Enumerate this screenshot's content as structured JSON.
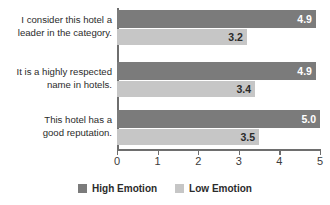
{
  "chart_data": {
    "type": "bar",
    "orientation": "horizontal",
    "title": "",
    "xlabel": "",
    "ylabel": "",
    "xlim": [
      0,
      5
    ],
    "grid": false,
    "legend_position": "bottom",
    "xticks": [
      "0",
      "1",
      "2",
      "3",
      "4",
      "5"
    ],
    "categories": [
      "I consider this hotel a leader in the category.",
      "It is a highly respected name in hotels.",
      "This hotel has a good reputation."
    ],
    "category_lines": [
      [
        "I consider this hotel a",
        "leader in the category."
      ],
      [
        "It is a highly respected",
        "name in hotels."
      ],
      [
        "This hotel has a",
        "good reputation."
      ]
    ],
    "series": [
      {
        "name": "High Emotion",
        "color": "#7b7b7b",
        "values": [
          4.9,
          4.9,
          5.0
        ],
        "labels": [
          "4.9",
          "4.9",
          "5.0"
        ]
      },
      {
        "name": "Low Emotion",
        "color": "#c6c6c6",
        "values": [
          3.2,
          3.4,
          3.5
        ],
        "labels": [
          "3.2",
          "3.4",
          "3.5"
        ]
      }
    ]
  },
  "legend": {
    "items": [
      {
        "label": "High Emotion",
        "color": "#7b7b7b"
      },
      {
        "label": "Low Emotion",
        "color": "#c6c6c6"
      }
    ]
  },
  "axis": {
    "ticks": [
      {
        "label": "0",
        "value": 0
      },
      {
        "label": "1",
        "value": 1
      },
      {
        "label": "2",
        "value": 2
      },
      {
        "label": "3",
        "value": 3
      },
      {
        "label": "4",
        "value": 4
      },
      {
        "label": "5",
        "value": 5
      }
    ]
  }
}
